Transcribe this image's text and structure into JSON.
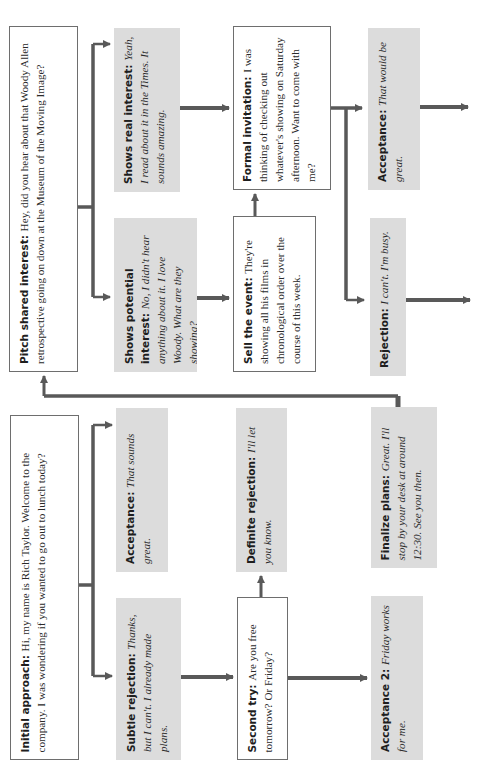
{
  "diagram": {
    "orientation": "rotated-90-ccw",
    "colors": {
      "response_box": "#dcdcdc",
      "prompt_box": "#ffffff",
      "connector": "#595959"
    },
    "nodes": {
      "pitch": {
        "label": "Pitch shared interest:",
        "text": "Hey, did you hear about that Woody Allen retrospective going on down at the Museum of the Moving Image?",
        "style": "prompt"
      },
      "real_interest": {
        "label": "Shows real interest:",
        "text": "Yeah, I read about it in the Times. It sounds amazing.",
        "style": "response"
      },
      "potential": {
        "label": "Shows potential interest:",
        "text": "No, I didn't hear anything about it. I love Woody. What are they showing?",
        "style": "response"
      },
      "formal": {
        "label": "Formal invitation:",
        "text": "I was thinking of checking out whatever's showing on Saturday afternoon. Want to come with me?",
        "style": "prompt"
      },
      "sell": {
        "label": "Sell the event:",
        "text": "They're showing all his films in chronological order over the course of this week.",
        "style": "prompt"
      },
      "accept_top": {
        "label": "Acceptance:",
        "text": "That would be great.",
        "style": "response"
      },
      "reject_top": {
        "label": "Rejection:",
        "text": "I can't. I'm busy.",
        "style": "response"
      },
      "initial": {
        "label": "Initial approach:",
        "text": "Hi, my name is Rich Taylor. Welcome to the company. I was wondering if you wanted to go out to lunch today?",
        "style": "prompt"
      },
      "accept_lunch": {
        "label": "Acceptance:",
        "text": "That sounds great.",
        "style": "response"
      },
      "subtle": {
        "label": "Subtle rejection:",
        "text": "Thanks, but I can't. I already made plans.",
        "style": "response"
      },
      "definite": {
        "label": "Definite rejection:",
        "text": "I'll let you know.",
        "style": "response"
      },
      "second": {
        "label": "Second try:",
        "text": "Are you free tomorrow? Or Friday?",
        "style": "prompt"
      },
      "finalize": {
        "label": "Finalize plans:",
        "text": "Great. I'll stop by your desk at around 12:30. See you then.",
        "style": "response"
      },
      "accept2": {
        "label": "Acceptance 2:",
        "text": "Friday works for me.",
        "style": "response"
      }
    },
    "edges": [
      [
        "initial",
        "accept_lunch"
      ],
      [
        "initial",
        "subtle"
      ],
      [
        "accept_lunch",
        "finalize"
      ],
      [
        "subtle",
        "second"
      ],
      [
        "second",
        "definite"
      ],
      [
        "second",
        "accept2"
      ],
      [
        "definite",
        "pitch"
      ],
      [
        "pitch",
        "real_interest"
      ],
      [
        "pitch",
        "potential"
      ],
      [
        "real_interest",
        "formal"
      ],
      [
        "potential",
        "sell"
      ],
      [
        "sell",
        "formal"
      ],
      [
        "formal",
        "accept_top"
      ],
      [
        "formal",
        "reject_top"
      ]
    ]
  }
}
